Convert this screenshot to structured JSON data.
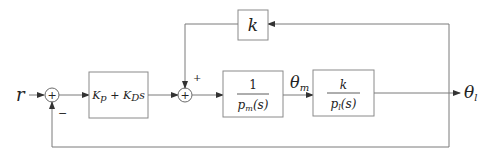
{
  "diagram": {
    "type": "block-diagram",
    "input_label": "r",
    "output_label_intermediate": "θ",
    "output_label_intermediate_sub": "m",
    "output_label_final": "θ",
    "output_label_final_sub": "l",
    "summing_junctions": [
      {
        "id": "sum1",
        "symbol": "+",
        "inputs": [
          "r (+)",
          "feedback θl (−)"
        ],
        "minus_sign": "−"
      },
      {
        "id": "sum2",
        "symbol": "+",
        "inputs": [
          "controller output",
          "k·θl (+)"
        ],
        "plus_sign": "+"
      }
    ],
    "blocks": [
      {
        "id": "controller",
        "label_a": "K",
        "label_a_sub": "p",
        "label_plus": " + ",
        "label_b": "K",
        "label_b_sub": "D",
        "label_s": "s"
      },
      {
        "id": "motor",
        "numerator": "1",
        "denominator": "p",
        "denominator_sub": "m",
        "denominator_arg": "(s)"
      },
      {
        "id": "load",
        "numerator": "k",
        "denominator": "p",
        "denominator_sub": "l",
        "denominator_arg": "(s)"
      },
      {
        "id": "spring_feedback",
        "label": "k"
      }
    ],
    "connections": [
      "r → sum1",
      "sum1 → controller",
      "controller → sum2",
      "sum2 → motor",
      "motor → load (θm)",
      "load → θl",
      "θl → spring_feedback → sum2 (+)",
      "θl → sum1 (−)"
    ],
    "colors": {
      "line": "#7a7a7a",
      "text": "#222222"
    }
  }
}
